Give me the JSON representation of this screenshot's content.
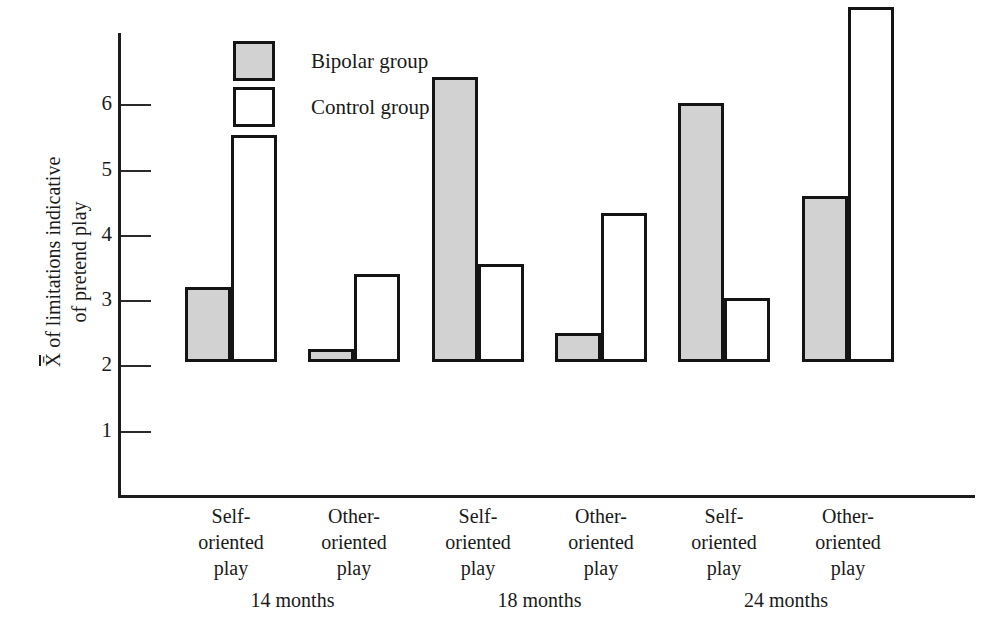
{
  "chart_data": {
    "type": "bar",
    "title": "",
    "xlabel": "",
    "ylabel_line1": "X of limitations indicative",
    "ylabel_line2": "of pretend play",
    "ylim": [
      0,
      6.5
    ],
    "yticks": [
      1,
      2,
      3,
      4,
      5,
      6
    ],
    "ytick_labels": [
      "1",
      "2",
      "3",
      "4",
      "5",
      "6"
    ],
    "grid": false,
    "legend_position": "top-left-inside",
    "categories": [
      "Self-oriented play",
      "Other-oriented play",
      "Self-oriented play",
      "Other-oriented play",
      "Self-oriented play",
      "Other-oriented play"
    ],
    "category_lines": [
      [
        "Self-",
        "oriented",
        "play"
      ],
      [
        "Other-",
        "oriented",
        "play"
      ],
      [
        "Self-",
        "oriented",
        "play"
      ],
      [
        "Other-",
        "oriented",
        "play"
      ],
      [
        "Self-",
        "oriented",
        "play"
      ],
      [
        "Other-",
        "oriented",
        "play"
      ]
    ],
    "groups": [
      "14 months",
      "18 months",
      "24 months"
    ],
    "series": [
      {
        "name": "Bipolar group",
        "color": "#d2d2d2",
        "values": [
          1.15,
          0.2,
          4.36,
          0.45,
          3.97,
          2.55
        ]
      },
      {
        "name": "Control group",
        "color": "#ffffff",
        "values": [
          3.48,
          1.35,
          1.5,
          2.28,
          0.98,
          5.44
        ]
      }
    ],
    "bars": [
      {
        "group": "14 months",
        "category": "Self-oriented play",
        "series": "Bipolar group",
        "value": 1.15
      },
      {
        "group": "14 months",
        "category": "Self-oriented play",
        "series": "Control group",
        "value": 3.48
      },
      {
        "group": "14 months",
        "category": "Other-oriented play",
        "series": "Bipolar group",
        "value": 0.2
      },
      {
        "group": "14 months",
        "category": "Other-oriented play",
        "series": "Control group",
        "value": 1.35
      },
      {
        "group": "18 months",
        "category": "Self-oriented play",
        "series": "Bipolar group",
        "value": 4.36
      },
      {
        "group": "18 months",
        "category": "Self-oriented play",
        "series": "Control group",
        "value": 1.5
      },
      {
        "group": "18 months",
        "category": "Other-oriented play",
        "series": "Bipolar group",
        "value": 0.45
      },
      {
        "group": "18 months",
        "category": "Other-oriented play",
        "series": "Control group",
        "value": 2.28
      },
      {
        "group": "24 months",
        "category": "Self-oriented play",
        "series": "Bipolar group",
        "value": 3.97
      },
      {
        "group": "24 months",
        "category": "Self-oriented play",
        "series": "Control group",
        "value": 0.98
      },
      {
        "group": "24 months",
        "category": "Other-oriented play",
        "series": "Bipolar group",
        "value": 2.55
      },
      {
        "group": "24 months",
        "category": "Other-oriented play",
        "series": "Control group",
        "value": 5.44
      }
    ]
  },
  "legend": {
    "items": [
      {
        "label": "Bipolar group",
        "swatch": "bipolar"
      },
      {
        "label": "Control group",
        "swatch": "control"
      }
    ]
  },
  "axis": {
    "x_symbol": "X",
    "y_unit_px": 65.3,
    "baseline_px": 497
  }
}
